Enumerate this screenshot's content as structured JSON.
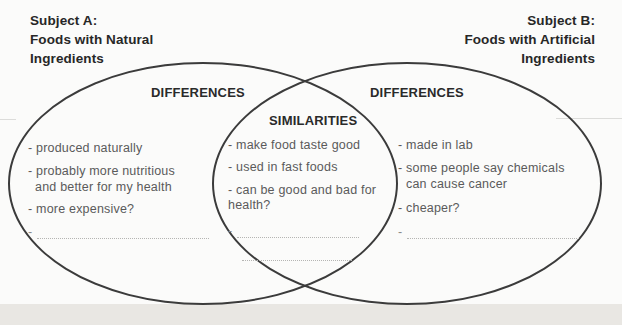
{
  "titles": {
    "subject_a": [
      "Subject A:",
      "Foods with Natural",
      "Ingredients"
    ],
    "subject_b": [
      "Subject B:",
      "Foods with Artificial",
      "Ingredients"
    ]
  },
  "labels": {
    "left_differences": "DIFFERENCES",
    "right_differences": "DIFFERENCES",
    "similarities": "SIMILARITIES",
    "blank_prefix": "-"
  },
  "sections": {
    "left_circle": {
      "lines": [
        "- produced naturally",
        "- probably more nutritious",
        "and better for my health",
        "- more expensive?"
      ]
    },
    "overlap": {
      "lines": [
        "- make food taste good",
        "- used in fast foods",
        "- can be good and bad for",
        "health?"
      ]
    },
    "right_circle": {
      "lines": [
        "- made in lab",
        "- some people say chemicals",
        "can cause cancer",
        "- cheaper?"
      ]
    }
  },
  "colors": {
    "ellipse_stroke": "#3b3b3b",
    "heading_text": "#272727",
    "handwriting_text": "#5a5a5a",
    "blank_dotted_line": "#b5b5b3",
    "page_edge": "#e9e7e3"
  }
}
